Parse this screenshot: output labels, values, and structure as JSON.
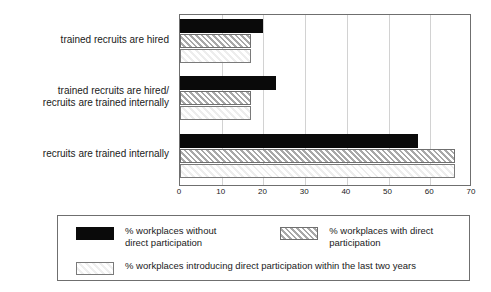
{
  "chart_data": {
    "type": "bar",
    "orientation": "horizontal",
    "title": "",
    "xlabel": "",
    "ylabel": "",
    "xlim": [
      0,
      70
    ],
    "xticks": [
      0,
      10,
      20,
      30,
      40,
      50,
      60,
      70
    ],
    "grid": true,
    "legend_position": "bottom",
    "categories": [
      "trained recruits are hired",
      "trained recruits are hired/\nrecruits are trained internally",
      "recruits are trained internally"
    ],
    "series": [
      {
        "name": "% workplaces without\ndirect participation",
        "legend_label": "% workplaces without\ndirect participation",
        "style": "solid-black",
        "color": "#0a0a0a",
        "values": [
          20,
          23,
          57
        ]
      },
      {
        "name": "% workplaces with direct\nparticipation",
        "legend_label": "% workplaces with direct\nparticipation",
        "style": "diagonal-hatch",
        "color": "#d8d8d8",
        "values": [
          17,
          17,
          66
        ]
      },
      {
        "name": "% workplaces introducing direct participation within the last two years",
        "legend_label": "% workplaces introducing direct participation within the last two years",
        "style": "light-fill",
        "color": "#f2f2f2",
        "values": [
          17,
          17,
          66
        ]
      }
    ]
  }
}
